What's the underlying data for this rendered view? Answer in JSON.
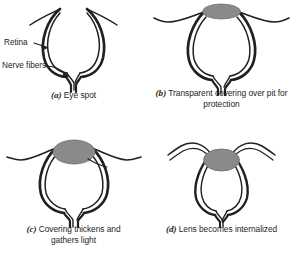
{
  "figure": {
    "background_color": "#ffffff",
    "ink_color": "#231f20",
    "lens_fill_color": "#8a8a8a",
    "lens_stroke_color": "#6e6e6e"
  },
  "panels": [
    {
      "id": "a",
      "tag": "(a)",
      "caption": "Eye spot",
      "caption_full": "(a) Eye spot",
      "has_lens": false,
      "lens_label": null
    },
    {
      "id": "b",
      "tag": "(b)",
      "caption": "Transparent covering over pit for protection",
      "caption_line_1": "Transparent covering over pit for",
      "caption_line_2": "protection",
      "caption_full": "(b) Transparent covering over pit for protection",
      "has_lens": true,
      "lens_label": null
    },
    {
      "id": "c",
      "tag": "(c)",
      "caption": "Covering thickens and gathers light",
      "caption_line_1": "Covering thickens and",
      "caption_line_2": "gathers light",
      "caption_full": "(c) Covering thickens and gathers light",
      "has_lens": true,
      "lens_label": "Lens"
    },
    {
      "id": "d",
      "tag": "(d)",
      "caption": "Lens becomes internalized",
      "caption_full": "(d) Lens becomes internalized",
      "has_lens": true,
      "lens_label": null
    }
  ],
  "callouts": {
    "retina": "Retina",
    "nerve_fibers": "Nerve fibers",
    "lens": "Lens"
  }
}
